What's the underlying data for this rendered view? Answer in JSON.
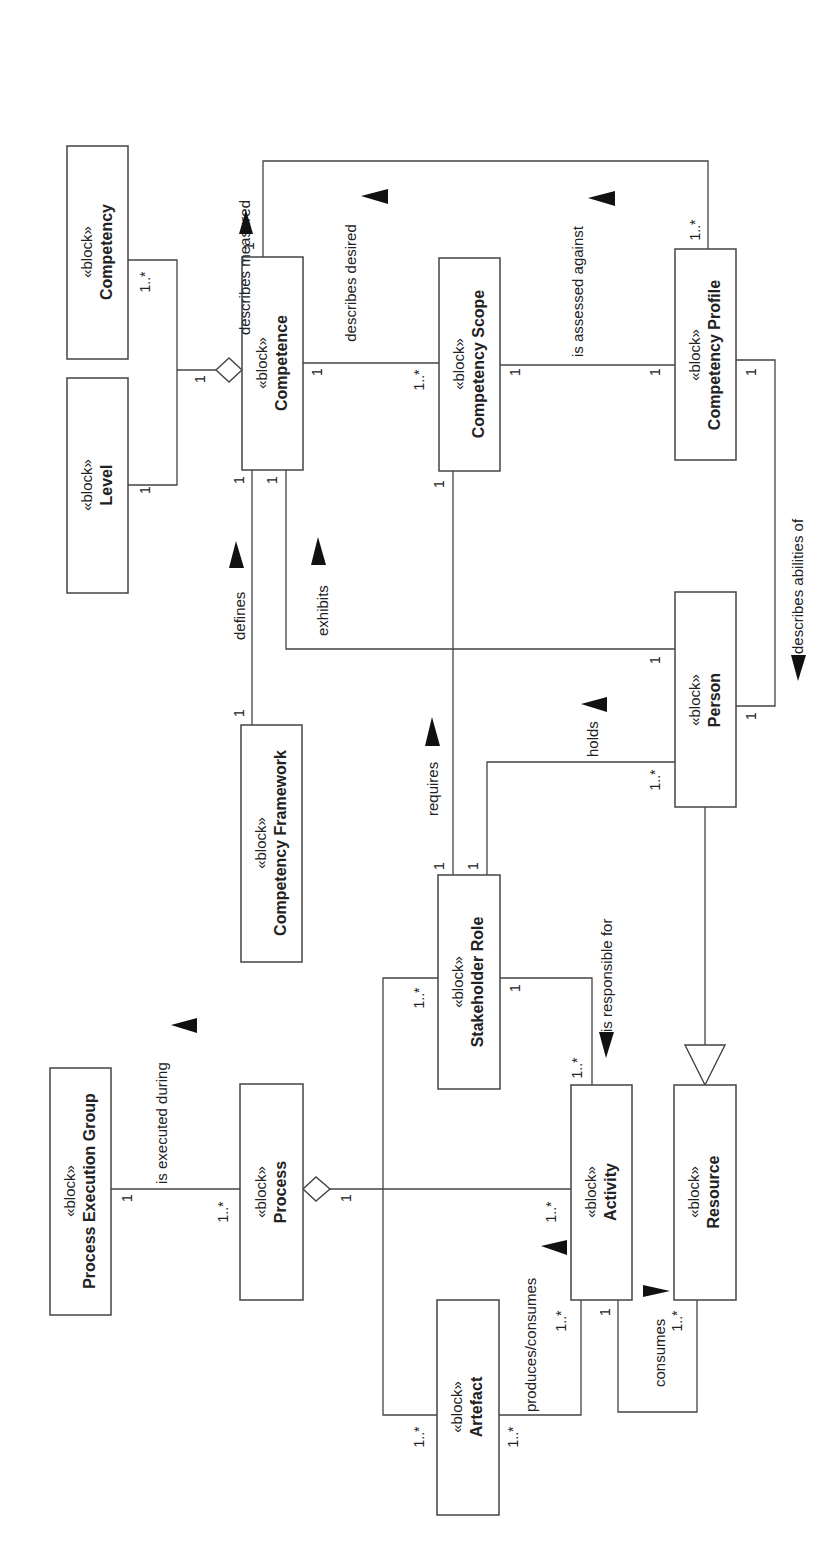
{
  "diagram": {
    "orientation": "rotated 90 degrees counter-clockwise",
    "stereotype": "«block»",
    "blocks": {
      "competency": "Competency",
      "level": "Level",
      "competence": "Competence",
      "competency_scope": "Competency Scope",
      "competency_profile": "Competency Profile",
      "competency_framework": "Competency Framework",
      "person": "Person",
      "process_execution_group": "Process Execution Group",
      "process": "Process",
      "stakeholder_role": "Stakeholder Role",
      "activity": "Activity",
      "resource": "Resource",
      "artefact": "Artefact"
    },
    "associations": {
      "describes_measured": {
        "label": "describes measured",
        "from": "Competency Profile",
        "to": "Competence",
        "mult_from": "1..*",
        "mult_to": "1"
      },
      "describes_desired": {
        "label": "describes desired",
        "from": "Competency Scope",
        "to": "Competence",
        "mult_from": "1..*",
        "mult_to": "1"
      },
      "is_assessed_against": {
        "label": "is assessed against",
        "from": "Competency Profile",
        "to": "Competency Scope",
        "mult_from": "1",
        "mult_to": "1"
      },
      "describes_abilities_of": {
        "label": "describes abilities of",
        "from": "Competency Profile",
        "to": "Person",
        "mult_from": "1",
        "mult_to": "1"
      },
      "defines": {
        "label": "defines",
        "from": "Competency Framework",
        "to": "Competence",
        "mult_from": "1",
        "mult_to": "1"
      },
      "exhibits": {
        "label": "exhibits",
        "from": "Person",
        "to": "Competence",
        "mult_from": "1",
        "mult_to": "1"
      },
      "requires": {
        "label": "requires",
        "from": "Stakeholder Role",
        "to": "Competency Scope",
        "mult_from": "1",
        "mult_to": "1"
      },
      "holds": {
        "label": "holds",
        "from": "Person",
        "to": "Stakeholder Role",
        "mult_from": "1..*",
        "mult_to": "1"
      },
      "is_executed_during": {
        "label": "is executed during",
        "from": "Process",
        "to": "Process Execution Group",
        "mult_from": "1..*",
        "mult_to": "1"
      },
      "is_responsible_for": {
        "label": "is responsible for",
        "from": "Stakeholder Role",
        "to": "Activity",
        "mult_from": "1",
        "mult_to": "1..*"
      },
      "produces_consumes": {
        "label": "produces/consumes",
        "from": "Activity",
        "to": "Artefact",
        "mult_from": "1..*",
        "mult_to": "1..*"
      },
      "consumes": {
        "label": "consumes",
        "from": "Activity",
        "to": "Resource",
        "mult_from": "1",
        "mult_to": "1..*"
      },
      "stakeholder_artefact": {
        "label": "",
        "from": "Stakeholder Role",
        "to": "Artefact",
        "mult_from": "1..*",
        "mult_to": "1..*"
      }
    },
    "aggregations": {
      "competence_parts": {
        "whole": "Competence",
        "parts": [
          "Competency",
          "Level"
        ],
        "mult_whole": "1",
        "mult_competency": "1..*",
        "mult_level": "1"
      },
      "process_parts": {
        "whole": "Process",
        "parts": [
          "Activity"
        ],
        "mult_whole": "1",
        "mult_part": "1..*"
      }
    },
    "generalizations": {
      "person_is_resource": {
        "child": "Person",
        "parent": "Resource"
      }
    },
    "multiplicities": {
      "one": "1",
      "many": "1..*"
    }
  }
}
